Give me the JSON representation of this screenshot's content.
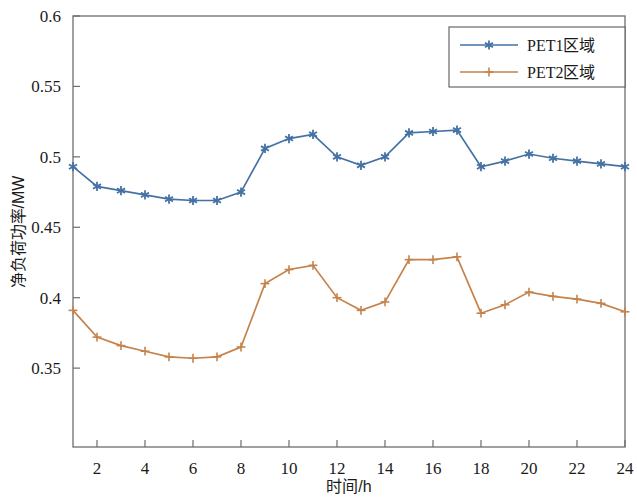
{
  "chart_data": {
    "type": "line",
    "title": "",
    "xlabel": "时间/h",
    "ylabel": "净负荷功率/MW",
    "xlim": [
      1,
      24
    ],
    "ylim": [
      0.294,
      0.6
    ],
    "grid": false,
    "legend_position": "top-right",
    "x": [
      1,
      2,
      3,
      4,
      5,
      6,
      7,
      8,
      9,
      10,
      11,
      12,
      13,
      14,
      15,
      16,
      17,
      18,
      19,
      20,
      21,
      22,
      23,
      24
    ],
    "xticks": [
      2,
      4,
      6,
      8,
      10,
      12,
      14,
      16,
      18,
      20,
      22,
      24
    ],
    "xtick_labels": [
      "2",
      "4",
      "6",
      "8",
      "10",
      "12",
      "14",
      "16",
      "18",
      "20",
      "22",
      "24"
    ],
    "yticks": [
      0.35,
      0.4,
      0.45,
      0.5,
      0.55,
      0.6
    ],
    "ytick_labels": [
      "0.35",
      "0.4",
      "0.45",
      "0.5",
      "0.55",
      "0.6"
    ],
    "series": [
      {
        "name": "PET1区域",
        "color": "#4472a4",
        "marker": "asterisk",
        "values": [
          0.493,
          0.479,
          0.476,
          0.473,
          0.47,
          0.469,
          0.469,
          0.475,
          0.506,
          0.513,
          0.516,
          0.5,
          0.494,
          0.5,
          0.517,
          0.518,
          0.519,
          0.493,
          0.497,
          0.502,
          0.499,
          0.497,
          0.495,
          0.493
        ]
      },
      {
        "name": "PET2区域",
        "color": "#c5824a",
        "marker": "plus",
        "values": [
          0.391,
          0.372,
          0.366,
          0.362,
          0.358,
          0.357,
          0.358,
          0.365,
          0.41,
          0.42,
          0.423,
          0.4,
          0.391,
          0.397,
          0.427,
          0.427,
          0.429,
          0.389,
          0.395,
          0.404,
          0.401,
          0.399,
          0.396,
          0.39
        ]
      }
    ]
  },
  "legend": {
    "entries": [
      {
        "label": "PET1区域"
      },
      {
        "label": "PET2区域"
      }
    ]
  },
  "axes": {
    "x_title": "时间/h",
    "y_title": "净负荷功率/MW"
  }
}
